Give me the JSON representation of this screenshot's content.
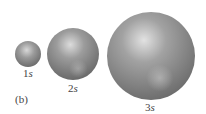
{
  "figure": {
    "panel_label": "(b)",
    "orbitals": [
      {
        "number": "1",
        "letter": "s",
        "label": "1s",
        "cx": 28,
        "cy": 54,
        "r": 13
      },
      {
        "number": "2",
        "letter": "s",
        "label": "2s",
        "cx": 73,
        "cy": 54,
        "r": 26
      },
      {
        "number": "3",
        "letter": "s",
        "label": "3s",
        "cx": 151,
        "cy": 56,
        "r": 44
      }
    ],
    "colors": {
      "sphere_base": "#7a7a7a",
      "sphere_highlight": "#d8d8d8",
      "sphere_shadow": "#4a4a4a"
    }
  }
}
